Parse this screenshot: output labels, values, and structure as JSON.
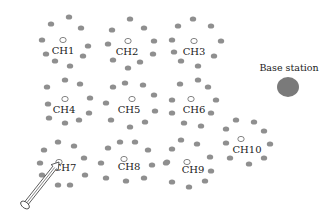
{
  "diagram": {
    "title": "",
    "colors": {
      "node": "#8f8f8f",
      "cluster_head_stroke": "#666666",
      "base_station": "#7a7a7a",
      "text": "#222222",
      "arrow": "#333333"
    },
    "base_station": {
      "label": "Base station",
      "cx": 288,
      "cy": 87,
      "rx": 11,
      "ry": 10,
      "label_x": 289,
      "label_y": 71
    },
    "clusters": [
      {
        "label": "CH1",
        "ch": [
          63,
          40
        ],
        "label_pos": [
          63,
          54
        ],
        "nodes": [
          [
            69,
            17
          ],
          [
            51,
            24
          ],
          [
            81,
            28
          ],
          [
            42,
            40
          ],
          [
            88,
            46
          ],
          [
            46,
            54
          ],
          [
            83,
            56
          ],
          [
            55,
            61
          ],
          [
            70,
            66
          ]
        ]
      },
      {
        "label": "CH2",
        "ch": [
          128,
          41
        ],
        "label_pos": [
          127,
          55
        ],
        "nodes": [
          [
            130,
            19
          ],
          [
            112,
            30
          ],
          [
            144,
            28
          ],
          [
            108,
            44
          ],
          [
            154,
            41
          ],
          [
            113,
            60
          ],
          [
            153,
            54
          ],
          [
            140,
            62
          ],
          [
            128,
            68
          ]
        ]
      },
      {
        "label": "CH3",
        "ch": [
          194,
          41
        ],
        "label_pos": [
          194,
          55
        ],
        "nodes": [
          [
            193,
            19
          ],
          [
            178,
            26
          ],
          [
            211,
            26
          ],
          [
            172,
            40
          ],
          [
            221,
            41
          ],
          [
            174,
            52
          ],
          [
            214,
            56
          ],
          [
            181,
            61
          ],
          [
            198,
            66
          ]
        ]
      },
      {
        "label": "CH4",
        "ch": [
          65,
          99
        ],
        "label_pos": [
          64,
          113
        ],
        "nodes": [
          [
            47,
            87
          ],
          [
            65,
            80
          ],
          [
            80,
            84
          ],
          [
            48,
            104
          ],
          [
            90,
            98
          ],
          [
            49,
            118
          ],
          [
            65,
            123
          ],
          [
            79,
            120
          ],
          [
            89,
            113
          ]
        ]
      },
      {
        "label": "CH5",
        "ch": [
          132,
          99
        ],
        "label_pos": [
          129,
          113
        ],
        "nodes": [
          [
            113,
            87
          ],
          [
            125,
            83
          ],
          [
            143,
            85
          ],
          [
            106,
            103
          ],
          [
            154,
            95
          ],
          [
            155,
            111
          ],
          [
            111,
            120
          ],
          [
            145,
            122
          ],
          [
            130,
            127
          ]
        ]
      },
      {
        "label": "CH6",
        "ch": [
          191,
          99
        ],
        "label_pos": [
          194,
          113
        ],
        "nodes": [
          [
            180,
            84
          ],
          [
            198,
            80
          ],
          [
            208,
            87
          ],
          [
            172,
            100
          ],
          [
            216,
            100
          ],
          [
            172,
            113
          ],
          [
            211,
            113
          ],
          [
            184,
            123
          ],
          [
            201,
            126
          ]
        ]
      },
      {
        "label": "CH7",
        "ch": [
          59,
          162
        ],
        "label_pos": [
          65,
          171
        ],
        "nodes": [
          [
            58,
            142
          ],
          [
            74,
            146
          ],
          [
            44,
            150
          ],
          [
            40,
            163
          ],
          [
            84,
            158
          ],
          [
            42,
            175
          ],
          [
            85,
            175
          ],
          [
            58,
            185
          ],
          [
            70,
            185
          ]
        ]
      },
      {
        "label": "CH8",
        "ch": [
          124,
          159
        ],
        "label_pos": [
          129,
          170
        ],
        "nodes": [
          [
            120,
            142
          ],
          [
            135,
            142
          ],
          [
            108,
            148
          ],
          [
            148,
            150
          ],
          [
            101,
            163
          ],
          [
            152,
            165
          ],
          [
            167,
            162
          ],
          [
            106,
            178
          ],
          [
            126,
            181
          ],
          [
            144,
            178
          ]
        ]
      },
      {
        "label": "CH9",
        "ch": [
          187,
          162
        ],
        "label_pos": [
          193,
          173
        ],
        "nodes": [
          [
            181,
            140
          ],
          [
            197,
            144
          ],
          [
            172,
            149
          ],
          [
            166,
            163
          ],
          [
            210,
            157
          ],
          [
            211,
            171
          ],
          [
            172,
            182
          ],
          [
            189,
            187
          ],
          [
            205,
            181
          ]
        ]
      },
      {
        "label": "CH10",
        "ch": [
          241,
          139
        ],
        "label_pos": [
          247,
          153
        ],
        "nodes": [
          [
            236,
            120
          ],
          [
            254,
            122
          ],
          [
            264,
            131
          ],
          [
            226,
            129
          ],
          [
            270,
            144
          ],
          [
            226,
            143
          ],
          [
            230,
            158
          ],
          [
            264,
            158
          ],
          [
            249,
            164
          ]
        ]
      }
    ],
    "arrow": {
      "from": [
        25,
        205
      ],
      "to": [
        59,
        162
      ],
      "description": "hollow arrow pointing to CH7"
    }
  }
}
